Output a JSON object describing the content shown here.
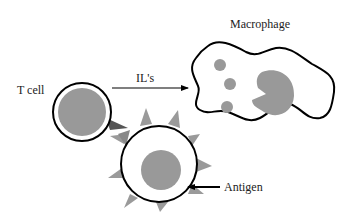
{
  "diagram": {
    "labels": {
      "macrophage": "Macrophage",
      "t_cell": "T cell",
      "interleukins": "IL's",
      "antigen": "Antigen"
    },
    "colors": {
      "outline": "#000000",
      "nucleus": "#999999",
      "spike": "#9a9a9a",
      "receptor": "#555555",
      "background": "#ffffff"
    },
    "nodes": [
      {
        "id": "t-cell",
        "label": "T cell"
      },
      {
        "id": "antigen-presenting-cell",
        "label": "Antigen"
      },
      {
        "id": "macrophage",
        "label": "Macrophage"
      }
    ],
    "edges": [
      {
        "from": "t-cell",
        "to": "macrophage",
        "label": "IL's"
      },
      {
        "from": "antigen-label",
        "to": "antigen-presenting-cell",
        "label": "Antigen"
      }
    ]
  }
}
